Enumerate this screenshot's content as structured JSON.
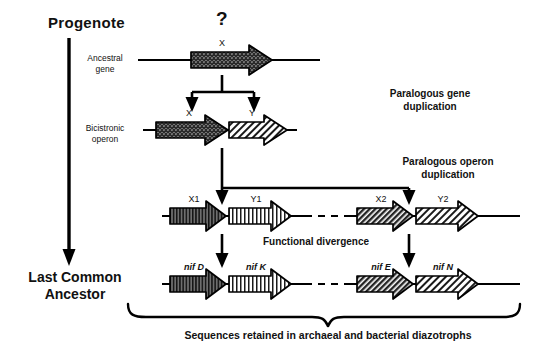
{
  "figure": {
    "type": "diagram",
    "background": "#ffffff",
    "ink": "#000000"
  },
  "timeline": {
    "top_label": "Progenote",
    "bottom_label_line1": "Last Common",
    "bottom_label_line2": "Ancestor",
    "axis_name": "time-axis-arrow"
  },
  "unknown_marker": "?",
  "rows": [
    {
      "id": "row-ancestral",
      "side_label_line1": "Ancestral",
      "side_label_line2": "gene",
      "genes": [
        {
          "label": "X",
          "fill": "crosshatch-dark",
          "italic": false
        }
      ]
    },
    {
      "id": "row-bicistronic",
      "side_label_line1": "Bicistronic",
      "side_label_line2": "operon",
      "genes": [
        {
          "label": "X",
          "fill": "crosshatch-dark",
          "italic": false
        },
        {
          "label": "Y",
          "fill": "diagonal-light",
          "italic": false
        }
      ]
    },
    {
      "id": "row-duplicated-operons",
      "side_label_line1": "",
      "side_label_line2": "",
      "genes": [
        {
          "label": "X1",
          "fill": "vertical-dark",
          "italic": false
        },
        {
          "label": "Y1",
          "fill": "vertical-light",
          "italic": false
        },
        {
          "label": "X2",
          "fill": "diagonal-dark",
          "italic": false
        },
        {
          "label": "Y2",
          "fill": "diagonal-light",
          "italic": false
        }
      ]
    },
    {
      "id": "row-nif",
      "side_label_line1": "",
      "side_label_line2": "",
      "genes": [
        {
          "label": "nif D",
          "fill": "vertical-dark",
          "italic": true
        },
        {
          "label": "nif K",
          "fill": "vertical-light",
          "italic": true
        },
        {
          "label": "nif E",
          "fill": "diagonal-dark",
          "italic": true
        },
        {
          "label": "nif N",
          "fill": "diagonal-light",
          "italic": true
        }
      ]
    }
  ],
  "annotations": {
    "gene_duplication_line1": "Paralogous gene",
    "gene_duplication_line2": "duplication",
    "operon_duplication_line1": "Paralogous operon",
    "operon_duplication_line2": "duplication",
    "functional_divergence": "Functional divergence",
    "caption": "Sequences retained in archaeal and bacterial diazotrophs"
  }
}
